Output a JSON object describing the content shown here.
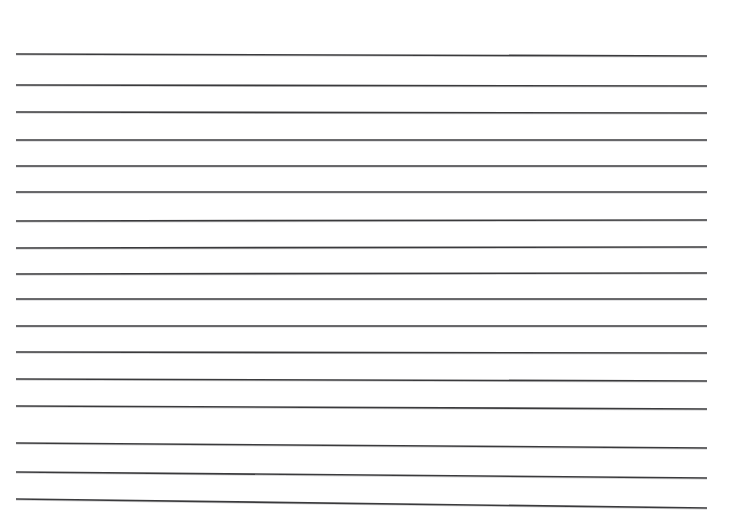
{
  "page": {
    "name": "ruled-paper-scan",
    "width": 736,
    "height": 530,
    "background_color": "#ffffff"
  },
  "ink": {
    "line_color": "#3a3a3c",
    "line_color_light": "#6d6d70",
    "line_thickness": 1.6,
    "top_faint_residue_color": "#fcfcfc"
  },
  "top_residue": {
    "visible": true,
    "text": "",
    "note": "faint clipped ink residue at very top edge"
  },
  "chart_data": {
    "type": "line",
    "title": "",
    "subtitle": "",
    "xlabel": "",
    "ylabel": "",
    "grid": false,
    "legend_position": "none",
    "xlim": [
      0,
      736
    ],
    "ylim": [
      0,
      530
    ],
    "units": "pixels",
    "line_count": 16,
    "x_start": 16,
    "x_end": 707,
    "series": [
      {
        "name": "rule-1",
        "index": 1,
        "x": [
          16,
          707
        ],
        "y": [
          54,
          56
        ]
      },
      {
        "name": "rule-2",
        "index": 2,
        "x": [
          16,
          707
        ],
        "y": [
          85,
          86
        ]
      },
      {
        "name": "rule-3",
        "index": 3,
        "x": [
          16,
          707
        ],
        "y": [
          112,
          113
        ]
      },
      {
        "name": "rule-4",
        "index": 4,
        "x": [
          16,
          707
        ],
        "y": [
          140,
          140
        ]
      },
      {
        "name": "rule-5",
        "index": 5,
        "x": [
          16,
          707
        ],
        "y": [
          166,
          166
        ]
      },
      {
        "name": "rule-6",
        "index": 6,
        "x": [
          16,
          707
        ],
        "y": [
          192,
          192
        ]
      },
      {
        "name": "rule-7",
        "index": 7,
        "x": [
          16,
          707
        ],
        "y": [
          221,
          220
        ]
      },
      {
        "name": "rule-8",
        "index": 8,
        "x": [
          16,
          707
        ],
        "y": [
          248,
          247
        ]
      },
      {
        "name": "rule-9",
        "index": 9,
        "x": [
          16,
          707
        ],
        "y": [
          274,
          273
        ]
      },
      {
        "name": "rule-10",
        "index": 10,
        "x": [
          16,
          707
        ],
        "y": [
          299,
          299
        ]
      },
      {
        "name": "rule-11",
        "index": 11,
        "x": [
          16,
          707
        ],
        "y": [
          326,
          326
        ]
      },
      {
        "name": "rule-12",
        "index": 12,
        "x": [
          16,
          707
        ],
        "y": [
          352,
          353
        ]
      },
      {
        "name": "rule-13",
        "index": 13,
        "x": [
          16,
          707
        ],
        "y": [
          379,
          381
        ]
      },
      {
        "name": "rule-14",
        "index": 14,
        "x": [
          16,
          707
        ],
        "y": [
          406,
          409
        ]
      },
      {
        "name": "rule-15",
        "index": 15,
        "x": [
          16,
          707
        ],
        "y": [
          443,
          448
        ]
      },
      {
        "name": "rule-16",
        "index": 16,
        "x": [
          16,
          707
        ],
        "y": [
          472,
          478
        ]
      },
      {
        "name": "rule-17",
        "index": 17,
        "x": [
          16,
          707
        ],
        "y": [
          499,
          508
        ]
      }
    ]
  }
}
